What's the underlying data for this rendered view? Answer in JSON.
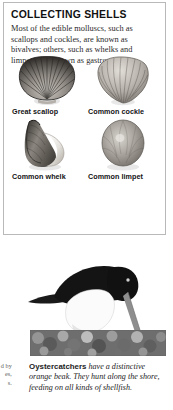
{
  "panel": {
    "title": "COLLECTING SHELLS",
    "intro": "Most of the edible molluscs, such as scallops and cockles, are known as bivalves; others, such as whelks and limpets, are known as gastropods.",
    "shells": [
      {
        "label": "Great scallop",
        "art": "scallop-shell"
      },
      {
        "label": "Common cockle",
        "art": "cockle-shell"
      },
      {
        "label": "Common whelk",
        "art": "whelk-shell"
      },
      {
        "label": "Common limpet",
        "art": "limpet-shell"
      }
    ]
  },
  "figure": {
    "photo_subject": "oystercatcher-on-rocky-shore",
    "caption_lead": "Oystercatchers",
    "caption_rest": " have a distinctive orange beak. They hunt along the shore, feeding on all kinds of shellfish."
  },
  "margin_scrap": {
    "line1": "d by",
    "line2": "es,",
    "line3": "s."
  },
  "colors": {
    "panel_border": "#b9b9b9",
    "text": "#1a1a1a",
    "shell_dark": "#3a3a3a",
    "shell_mid": "#8d8d8d",
    "shell_light": "#d8d8d8"
  }
}
